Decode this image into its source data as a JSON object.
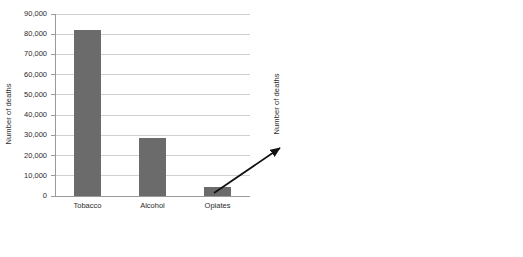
{
  "figure": {
    "background_color": "#ffffff",
    "bar_color": "#6b6b6b",
    "gridline_color": "#d0d0d0",
    "axis_color": "#9a9a9a",
    "text_color": "#2b2b2b",
    "annotation": {
      "type": "arrow",
      "name": "zoom-arrow",
      "description": "arrow pointing from the Opiates bar in the left chart to the detailed right chart"
    }
  },
  "chart_data": [
    {
      "type": "bar",
      "id": "left",
      "title": "",
      "xlabel": "",
      "ylabel": "Number of deaths",
      "categories": [
        "Tobacco",
        "Alcohol",
        "Opiates"
      ],
      "values": [
        82000,
        28500,
        4500
      ],
      "ylim": [
        0,
        90000
      ],
      "yticks": [
        0,
        10000,
        20000,
        30000,
        40000,
        50000,
        60000,
        70000,
        80000,
        90000
      ],
      "ytick_labels": [
        "0",
        "10,000",
        "20,000",
        "30,000",
        "40,000",
        "50,000",
        "60,000",
        "70,000",
        "80,000",
        "90,000"
      ],
      "grid": true,
      "legend": false,
      "xtick_rotation": 0
    },
    {
      "type": "bar",
      "id": "right",
      "title": "",
      "xlabel": "",
      "ylabel": "Number of deaths",
      "categories": [
        "Opiates",
        "Cocaine",
        "Paracetamol",
        "Amphetamine",
        "Ecstasy",
        "Cannabis",
        "Mephedrone"
      ],
      "values": [
        1780,
        240,
        200,
        85,
        45,
        20,
        10
      ],
      "ylim": [
        0,
        2000
      ],
      "yticks": [
        0,
        200,
        400,
        600,
        800,
        1000,
        1200,
        1400,
        1600,
        1800,
        2000
      ],
      "ytick_labels": [
        "0",
        "200",
        "400",
        "600",
        "800",
        "1,000",
        "1,200",
        "1,400",
        "1,600",
        "1,800",
        "2,000"
      ],
      "grid": true,
      "legend": false,
      "xtick_rotation": 45
    }
  ]
}
